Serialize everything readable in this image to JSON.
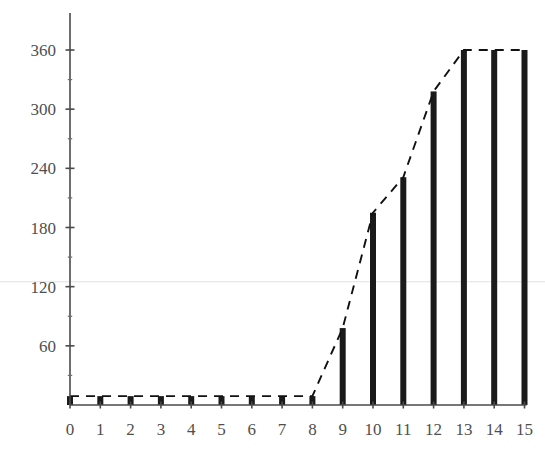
{
  "chart": {
    "title": "",
    "subtitle": "",
    "background_color": "#ffffff",
    "bar_color": "#1a1a1a",
    "trend_color": "#111111",
    "axis_color": "#4a4a4a",
    "gridline_color": "#e2e2e2"
  },
  "chart_data": {
    "type": "bar",
    "title": "",
    "xlabel": "",
    "ylabel": "",
    "categories": [
      "0",
      "1",
      "2",
      "3",
      "4",
      "5",
      "6",
      "7",
      "8",
      "9",
      "10",
      "11",
      "12",
      "13",
      "14",
      "15"
    ],
    "values": [
      9,
      9,
      9,
      9,
      9,
      9,
      9,
      9,
      9,
      78,
      195,
      231,
      318,
      360,
      360,
      360
    ],
    "series": [
      {
        "name": "bars",
        "type": "bar",
        "values": [
          9,
          9,
          9,
          9,
          9,
          9,
          9,
          9,
          9,
          78,
          195,
          231,
          318,
          360,
          360,
          360
        ]
      },
      {
        "name": "trend",
        "type": "line",
        "style": "dashed",
        "values": [
          9,
          9,
          9,
          9,
          9,
          9,
          9,
          9,
          9,
          78,
          195,
          231,
          318,
          360,
          360,
          360
        ]
      }
    ],
    "xlim": [
      0,
      15
    ],
    "ylim": [
      0,
      378
    ],
    "y_ticks": [
      60,
      120,
      180,
      240,
      300,
      360
    ],
    "y_tick_labels": [
      "60",
      "120",
      "180",
      "240",
      "300",
      "360"
    ],
    "y_minor_ticks": [
      30,
      90,
      150,
      210,
      270,
      330
    ],
    "x_ticks": [
      0,
      1,
      2,
      3,
      4,
      5,
      6,
      7,
      8,
      9,
      10,
      11,
      12,
      13,
      14,
      15
    ],
    "x_tick_labels": [
      "0",
      "1",
      "2",
      "3",
      "4",
      "5",
      "6",
      "7",
      "8",
      "9",
      "10",
      "11",
      "12",
      "13",
      "14",
      "15"
    ],
    "grid": false,
    "faint_gridlines": [
      125
    ],
    "legend": [],
    "legend_position": "none",
    "annotations": []
  }
}
